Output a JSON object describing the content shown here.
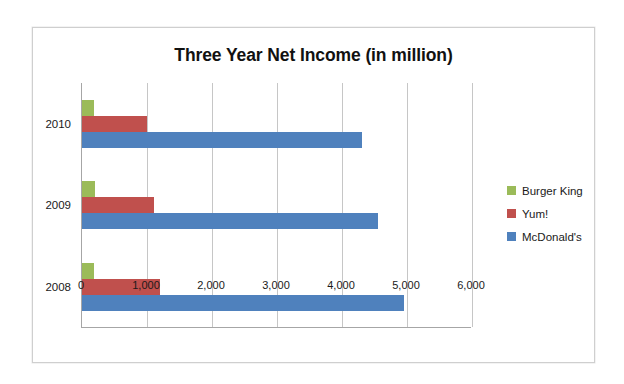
{
  "chart_data": {
    "type": "bar",
    "orientation": "horizontal",
    "title": "Three Year Net Income (in million)",
    "xlabel": "",
    "ylabel": "",
    "categories": [
      "2010",
      "2009",
      "2008"
    ],
    "series": [
      {
        "name": "Burger King",
        "color": "#9BBB59",
        "values": [
          186,
          200,
          190
        ]
      },
      {
        "name": "Yum!",
        "color": "#C0504D",
        "values": [
          1000,
          1100,
          1200
        ]
      },
      {
        "name": "McDonald's",
        "color": "#4F81BD",
        "values": [
          4300,
          4550,
          4950
        ]
      }
    ],
    "xlim": [
      0,
      6000
    ],
    "xticks": [
      0,
      1000,
      2000,
      3000,
      4000,
      5000,
      6000
    ],
    "xtick_labels": [
      "0",
      "1,000",
      "2,000",
      "3,000",
      "4,000",
      "5,000",
      "6,000"
    ],
    "grid": "vertical",
    "legend_position": "right",
    "legend_entries": [
      "Burger King",
      "Yum!",
      "McDonald's"
    ]
  },
  "colors": {
    "burger_king": "#9BBB59",
    "yum": "#C0504D",
    "mcdonalds": "#4F81BD",
    "gridline": "#c6c6c6",
    "axis": "#a6a6a6",
    "frame_border": "#cfcfcf",
    "text": "#1a1a1a",
    "background": "#ffffff"
  }
}
